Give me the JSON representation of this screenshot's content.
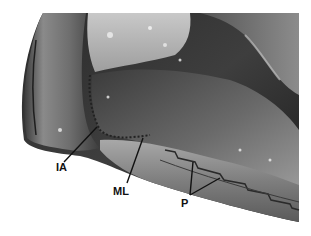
{
  "figure": {
    "type": "anatomical-photograph",
    "tone": "grayscale",
    "labels": [
      {
        "id": "IA",
        "text": "IA",
        "x": 56,
        "y": 162,
        "pointer_to": [
          97,
          127
        ]
      },
      {
        "id": "ML",
        "text": "ML",
        "x": 114,
        "y": 185,
        "pointer_to": [
          143,
          137
        ]
      },
      {
        "id": "P",
        "text": "P",
        "x": 180,
        "y": 197,
        "pointer_to": [
          [
            193,
            162
          ],
          [
            220,
            178
          ]
        ]
      }
    ]
  },
  "colors": {
    "background": "#ffffff",
    "label_text": "#111111",
    "pointer_line": "#111111"
  }
}
